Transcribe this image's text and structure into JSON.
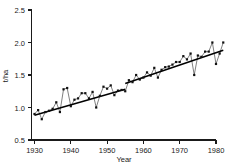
{
  "chart_data": {
    "type": "scatter",
    "title": "",
    "subtitle": "",
    "xlabel": "Year",
    "ylabel": "t/ha",
    "xlim": [
      1929,
      1983
    ],
    "ylim": [
      0.5,
      2.5
    ],
    "grid": false,
    "legend": null,
    "xticks": [
      1930,
      1940,
      1950,
      1960,
      1970,
      1980
    ],
    "xtick_labels": [
      "1930",
      "1940",
      "1950",
      "1960",
      "1970",
      "1980"
    ],
    "yticks": [
      0.5,
      1.0,
      1.5,
      2.0,
      2.5
    ],
    "ytick_labels": [
      "0.5",
      "1.0",
      "1.5",
      "2.0",
      "2.5"
    ],
    "marker": "filled-square",
    "series": [
      {
        "name": "Yield",
        "x": [
          1930,
          1931,
          1932,
          1933,
          1934,
          1935,
          1936,
          1937,
          1938,
          1939,
          1940,
          1941,
          1942,
          1943,
          1944,
          1945,
          1946,
          1947,
          1948,
          1949,
          1950,
          1951,
          1952,
          1953,
          1954,
          1955,
          1956,
          1957,
          1958,
          1959,
          1960,
          1961,
          1962,
          1963,
          1964,
          1965,
          1966,
          1967,
          1968,
          1969,
          1970,
          1971,
          1972,
          1973,
          1974,
          1975,
          1976,
          1977,
          1978,
          1979,
          1980,
          1981,
          1982
        ],
        "y": [
          0.9,
          0.96,
          0.82,
          0.93,
          0.95,
          0.98,
          1.08,
          0.93,
          1.28,
          1.3,
          1.02,
          1.12,
          1.14,
          1.22,
          1.22,
          1.14,
          1.24,
          1.0,
          1.18,
          1.32,
          1.29,
          1.34,
          1.19,
          1.26,
          1.27,
          1.25,
          1.42,
          1.39,
          1.5,
          1.43,
          1.46,
          1.54,
          1.49,
          1.61,
          1.46,
          1.58,
          1.62,
          1.63,
          1.66,
          1.7,
          1.7,
          1.79,
          1.74,
          1.83,
          1.5,
          1.8,
          1.78,
          1.86,
          1.86,
          2.0,
          1.67,
          1.83,
          2.0
        ]
      }
    ],
    "trend_lines": [
      {
        "name": "trend-segment-1",
        "x": [
          1930,
          1955
        ],
        "y": [
          0.88,
          1.28
        ]
      },
      {
        "name": "trend-segment-2",
        "x": [
          1955,
          1982
        ],
        "y": [
          1.37,
          1.88
        ]
      }
    ]
  }
}
